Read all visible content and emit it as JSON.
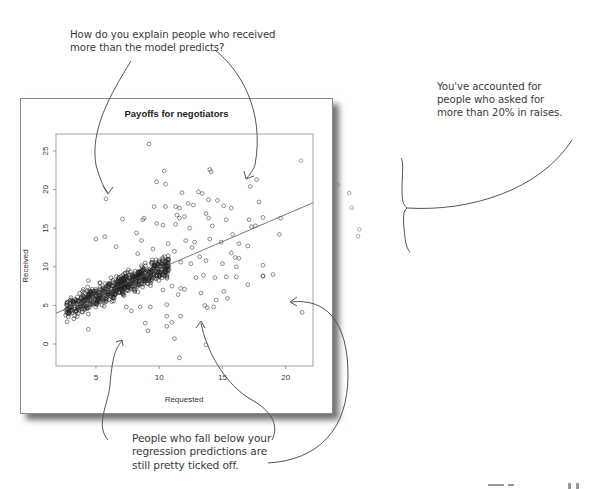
{
  "annotations": {
    "top": "How do you explain people who received\nmore than the model predicts?",
    "right": "You've accounted for\npeople who asked for\nmore than 20% in raises.",
    "bottom": "People who fall below your\nregression predictions are\nstill pretty ticked off."
  },
  "chart_data": {
    "type": "scatter",
    "title": "Payoffs for negotiators",
    "xlabel": "Requested",
    "ylabel": "Received",
    "xlim": [
      1.8,
      22.2
    ],
    "ylim": [
      -2.9,
      27.0
    ],
    "xticks": [
      5,
      10,
      15,
      20
    ],
    "yticks": [
      0,
      5,
      10,
      15,
      20,
      25
    ],
    "grid": false,
    "legend": null,
    "regression_line": {
      "slope": 0.705,
      "intercept": 2.68,
      "x_range": [
        1.84,
        22.15
      ]
    },
    "dense_cluster": {
      "description": "approx. 700 tightly packed points along the regression line",
      "x_range": [
        2.5,
        11
      ],
      "y_range": [
        3,
        11
      ]
    },
    "outlier_points": [
      [
        9.2,
        25.9
      ],
      [
        10.4,
        22.4
      ],
      [
        14,
        22.6
      ],
      [
        14.1,
        22.3
      ],
      [
        17.7,
        21.3
      ],
      [
        9.8,
        21
      ],
      [
        10.5,
        20.7
      ],
      [
        17.2,
        20.4
      ],
      [
        5.8,
        18.8
      ],
      [
        11.8,
        19.6
      ],
      [
        13.1,
        19.7
      ],
      [
        13.4,
        19.5
      ],
      [
        13.9,
        18.7
      ],
      [
        14.6,
        18.6
      ],
      [
        17.9,
        18.4
      ],
      [
        9.6,
        17.8
      ],
      [
        10.5,
        17.8
      ],
      [
        11.3,
        17.8
      ],
      [
        11.6,
        17.6
      ],
      [
        12.3,
        18.2
      ],
      [
        12.7,
        18
      ],
      [
        15.1,
        17.9
      ],
      [
        15.7,
        17.6
      ],
      [
        7.1,
        16.2
      ],
      [
        8.7,
        16.1
      ],
      [
        8.8,
        16.3
      ],
      [
        11.4,
        16.7
      ],
      [
        11.6,
        16.3
      ],
      [
        12,
        16.5
      ],
      [
        13.7,
        16.9
      ],
      [
        13.9,
        16.3
      ],
      [
        15.3,
        16.1
      ],
      [
        17.1,
        16.1
      ],
      [
        18.2,
        16.4
      ],
      [
        19.6,
        16.3
      ],
      [
        8.2,
        14.4
      ],
      [
        9.8,
        15.6
      ],
      [
        10.3,
        15.4
      ],
      [
        11.3,
        15.5
      ],
      [
        12.4,
        15
      ],
      [
        14.2,
        15.3
      ],
      [
        15.8,
        14.2
      ],
      [
        17.3,
        15.2
      ],
      [
        17.6,
        15.3
      ],
      [
        5,
        13.6
      ],
      [
        5.7,
        13.9
      ],
      [
        6.6,
        12.6
      ],
      [
        8.6,
        13.4
      ],
      [
        10.7,
        13
      ],
      [
        12.1,
        13.4
      ],
      [
        12.8,
        13.2
      ],
      [
        14,
        13.6
      ],
      [
        14.9,
        13.2
      ],
      [
        16.3,
        13
      ],
      [
        17,
        12.7
      ],
      [
        19.5,
        14.2
      ],
      [
        8.3,
        11.7
      ],
      [
        9.5,
        12.3
      ],
      [
        11.2,
        12
      ],
      [
        12.6,
        12.5
      ],
      [
        13.2,
        11.3
      ],
      [
        15.7,
        11.8
      ],
      [
        16,
        11.2
      ],
      [
        16.3,
        11.1
      ],
      [
        11.7,
        10.6
      ],
      [
        12.5,
        10.4
      ],
      [
        13.7,
        10.8
      ],
      [
        15,
        10.4
      ],
      [
        16.1,
        10
      ],
      [
        18.2,
        10.2
      ],
      [
        12.9,
        8.6
      ],
      [
        13.5,
        8.9
      ],
      [
        14.4,
        8.6
      ],
      [
        15.3,
        8.7
      ],
      [
        16.1,
        8.7
      ],
      [
        17,
        7.7
      ],
      [
        18.2,
        8.8
      ],
      [
        18.2,
        8.8
      ],
      [
        19,
        9
      ],
      [
        4.4,
        8.2
      ],
      [
        9.1,
        7.8
      ],
      [
        10.3,
        7
      ],
      [
        11,
        7.5
      ],
      [
        11.7,
        7.2
      ],
      [
        12,
        7.1
      ],
      [
        11.5,
        6.4
      ],
      [
        13.3,
        6.6
      ],
      [
        15.1,
        6.8
      ],
      [
        7.4,
        4.8
      ],
      [
        7.8,
        4.3
      ],
      [
        8.5,
        4.8
      ],
      [
        9.3,
        4.8
      ],
      [
        10.6,
        5.1
      ],
      [
        13.6,
        5
      ],
      [
        13.8,
        4.7
      ],
      [
        14.3,
        4.8
      ],
      [
        14.5,
        5.7
      ],
      [
        15.4,
        5.9
      ],
      [
        4.4,
        1.9
      ],
      [
        8.9,
        2.7
      ],
      [
        9.1,
        1.7
      ],
      [
        10.6,
        2.3
      ],
      [
        10.6,
        3.6
      ],
      [
        11,
        2.8
      ],
      [
        11.7,
        3.6
      ],
      [
        11.2,
        0.7
      ],
      [
        11.6,
        -1.8
      ],
      [
        21.3,
        4.1
      ],
      [
        13.7,
        -0.1
      ]
    ],
    "offchart_fragment_points": [
      [
        22.8,
        23.1
      ],
      [
        25.7,
        20
      ],
      [
        26.6,
        18.9
      ],
      [
        26.8,
        17
      ],
      [
        27.4,
        14.2
      ],
      [
        27.3,
        13.3
      ]
    ]
  }
}
